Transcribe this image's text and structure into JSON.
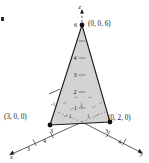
{
  "figure": {
    "type": "3d-coordinate-plane-diagram",
    "fill_color": "#cfcfcf",
    "stroke_color": "#1a1a1a",
    "background": "#ffffff"
  },
  "axes": [
    {
      "name": "x",
      "label": "x",
      "label_position": "lower-left"
    },
    {
      "name": "y",
      "label": "y",
      "label_position": "lower-right"
    },
    {
      "name": "z",
      "label": "z",
      "label_position": "top"
    }
  ],
  "vertices": [
    {
      "id": "x-intercept",
      "label": "(3, 0, 0)",
      "coords": [
        3,
        0,
        0
      ]
    },
    {
      "id": "y-intercept",
      "label": "(0, 2, 0)",
      "coords": [
        0,
        2,
        0
      ]
    },
    {
      "id": "z-intercept",
      "label": "(0, 0, 6)",
      "coords": [
        0,
        0,
        6
      ]
    }
  ],
  "ticks": {
    "z": [
      "6",
      "4",
      "3",
      "2",
      "1"
    ],
    "x": [
      "3",
      "4",
      "3"
    ],
    "y": [
      "3",
      "4"
    ],
    "interior": [
      "-1",
      "1",
      "1",
      "1"
    ]
  },
  "tick_labels": {
    "z_6": "6",
    "z_4": "4",
    "z_3": "3",
    "z_2": "2",
    "z_1": "1",
    "x_near": "3",
    "x_mid": "4",
    "x_far": "3",
    "y_near": "3",
    "y_mid": "4",
    "grid_neg1": "-1",
    "grid_1a": "1",
    "grid_1b": "1",
    "grid_1c": "1"
  }
}
